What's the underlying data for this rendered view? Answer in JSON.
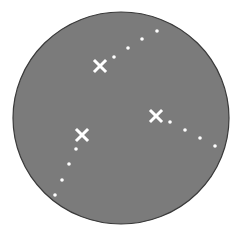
{
  "diagram": {
    "background": "#ffffff",
    "disk": {
      "cx": 121,
      "cy": 118,
      "rx": 108,
      "ry": 106,
      "fill": "#7b7b7b",
      "stroke": "#3a3a3a"
    },
    "marker_color": "#ffffff",
    "crosses": [
      {
        "id": "cross-1",
        "x": 100,
        "y": 66
      },
      {
        "id": "cross-2",
        "x": 156,
        "y": 116
      },
      {
        "id": "cross-3",
        "x": 82,
        "y": 135
      }
    ],
    "dot_trails": [
      {
        "id": "trail-1",
        "points": [
          [
            114,
            57
          ],
          [
            128,
            48
          ],
          [
            142,
            39
          ],
          [
            157,
            31
          ]
        ]
      },
      {
        "id": "trail-2",
        "points": [
          [
            170,
            122
          ],
          [
            185,
            130
          ],
          [
            200,
            138
          ],
          [
            215,
            146
          ]
        ]
      },
      {
        "id": "trail-3",
        "points": [
          [
            76,
            149
          ],
          [
            69,
            164
          ],
          [
            62,
            180
          ],
          [
            55,
            195
          ]
        ]
      }
    ]
  }
}
